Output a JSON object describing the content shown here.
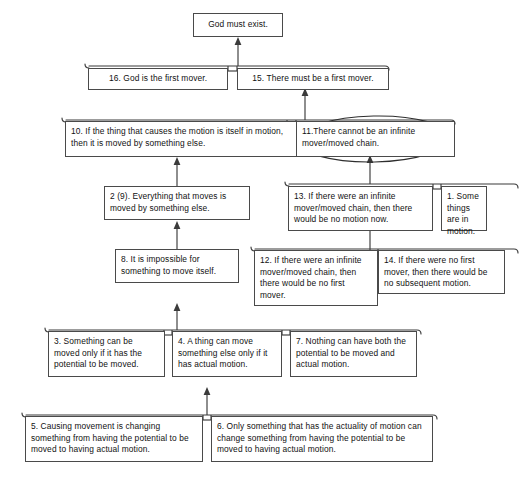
{
  "diagram": {
    "type": "argument-diagram",
    "colors": {
      "background": "#ffffff",
      "box_border": "#4a4a4a",
      "connector": "#3b3b3b",
      "annotation_ellipse": "#2e2e2e",
      "text": "#111111"
    }
  },
  "nodes": {
    "conclusion": {
      "id": "conclusion",
      "label": "God must exist."
    },
    "n16": {
      "id": "16",
      "label": "16. God is the first mover."
    },
    "n15": {
      "id": "15",
      "label": "15. There must be a first mover."
    },
    "n10": {
      "id": "10",
      "label": "10. If the thing that causes the motion is itself in motion, then it is moved by something else."
    },
    "n11": {
      "id": "11",
      "label": "11.There cannot be an infinite mover/moved chain.",
      "annotation": "circled"
    },
    "n2": {
      "id": "2 (9)",
      "label": "2 (9). Everything that moves is moved by something else."
    },
    "n13": {
      "id": "13",
      "label": "13. If there were an infinite mover/moved chain, then there would be no motion now."
    },
    "n1": {
      "id": "1",
      "label": "1. Some things are in motion."
    },
    "n8": {
      "id": "8",
      "label": "8. It is impossible for something to move itself."
    },
    "n12": {
      "id": "12",
      "label": "12. If there were an infinite mover/moved chain, then there would be no first mover."
    },
    "n14": {
      "id": "14",
      "label": "14. If there were no first mover, then there would be no subsequent motion."
    },
    "n3": {
      "id": "3",
      "label": "3. Something can be moved only if it has the potential to be moved."
    },
    "n4": {
      "id": "4",
      "label": "4. A thing can move something else only if it has actual motion."
    },
    "n7": {
      "id": "7",
      "label": "7. Nothing can have both the potential to be moved and actual motion."
    },
    "n5": {
      "id": "5",
      "label": "5. Causing movement is changing something from having the potential to be moved to having actual motion."
    },
    "n6": {
      "id": "6",
      "label": "6. Only something that has the actuality of motion can change something from having the potential to be moved to having actual motion."
    }
  },
  "links": [
    {
      "from": [
        "16",
        "15"
      ],
      "to": "conclusion",
      "kind": "linked"
    },
    {
      "from": [
        "10",
        "11"
      ],
      "to": "15",
      "kind": "linked"
    },
    {
      "from": [
        "2 (9)"
      ],
      "to": "10",
      "kind": "single"
    },
    {
      "from": [
        "13",
        "1"
      ],
      "to": "11",
      "kind": "linked"
    },
    {
      "from": [
        "8"
      ],
      "to": "2 (9)",
      "kind": "single"
    },
    {
      "from": [
        "12",
        "14"
      ],
      "to": "13",
      "kind": "linked"
    },
    {
      "from": [
        "3",
        "4",
        "7"
      ],
      "to": "8",
      "kind": "linked"
    },
    {
      "from": [
        "5",
        "6"
      ],
      "to": "4",
      "kind": "linked"
    }
  ]
}
